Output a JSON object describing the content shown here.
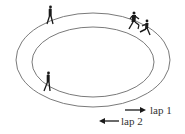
{
  "diagram": {
    "type": "running-track",
    "colors": {
      "track_line": "#7a7a7a",
      "runner": "#1a1a1a",
      "arrow": "#1a1a1a",
      "text": "#333333",
      "background": "#ffffff"
    },
    "track": {
      "outer": {
        "cx": 93,
        "cy": 60,
        "rx": 77,
        "ry": 47
      },
      "inner": {
        "cx": 93,
        "cy": 62,
        "rx": 61,
        "ry": 35
      }
    },
    "runners": [
      {
        "id": "runner-top-left",
        "x": 50,
        "y": 7,
        "pose": "walking"
      },
      {
        "id": "runner-top-right-1",
        "x": 133,
        "y": 13,
        "pose": "running"
      },
      {
        "id": "runner-top-right-2",
        "x": 146,
        "y": 21,
        "pose": "running"
      },
      {
        "id": "runner-bottom-left",
        "x": 48,
        "y": 73,
        "pose": "walking"
      }
    ],
    "legend": [
      {
        "label": "lap 1",
        "direction": "right"
      },
      {
        "label": "lap 2",
        "direction": "left"
      }
    ]
  }
}
